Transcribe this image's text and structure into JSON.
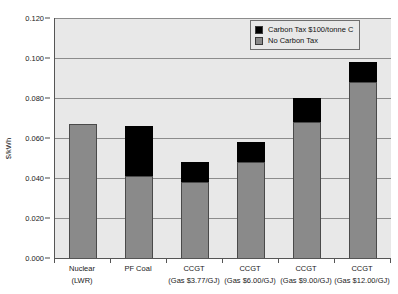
{
  "chart_data": {
    "type": "bar",
    "stacked": true,
    "title": "",
    "xlabel": "",
    "ylabel": "$/kWh",
    "ylim": [
      0.0,
      0.12
    ],
    "ytick_step": 0.02,
    "ytick_labels": [
      "0.000",
      "0.020",
      "0.040",
      "0.060",
      "0.080",
      "0.100",
      "0.120"
    ],
    "ytick_values": [
      0.0,
      0.02,
      0.04,
      0.06,
      0.08,
      0.1,
      0.12
    ],
    "grid": true,
    "legend_position": "top-right",
    "categories": [
      {
        "line1": "Nuclear",
        "line2": "(LWR)"
      },
      {
        "line1": "PF Coal",
        "line2": ""
      },
      {
        "line1": "CCGT",
        "line2": "(Gas $3.77/GJ)"
      },
      {
        "line1": "CCGT",
        "line2": "(Gas $6.00/GJ)"
      },
      {
        "line1": "CCGT",
        "line2": "(Gas $9.00/GJ)"
      },
      {
        "line1": "CCGT",
        "line2": "(Gas $12.00/GJ)"
      }
    ],
    "series": [
      {
        "name": "No Carbon Tax",
        "color": "#8a8a8a",
        "values": [
          0.067,
          0.041,
          0.038,
          0.048,
          0.068,
          0.088
        ]
      },
      {
        "name": "Carbon Tax $100/tonne C",
        "color": "#000000",
        "values": [
          0.0,
          0.025,
          0.01,
          0.01,
          0.012,
          0.01
        ]
      }
    ],
    "totals": [
      0.067,
      0.066,
      0.048,
      0.058,
      0.08,
      0.098
    ]
  },
  "legend": {
    "entries": [
      {
        "label": "Carbon Tax $100/tonne C",
        "color": "#000000"
      },
      {
        "label": "No Carbon Tax",
        "color": "#8a8a8a"
      }
    ]
  },
  "colors": {
    "plot_background": "#e8e8e8",
    "gridline": "#8c8c8c",
    "axis": "#555555",
    "no_tax_bar": "#8a8a8a",
    "tax_bar": "#000000"
  }
}
